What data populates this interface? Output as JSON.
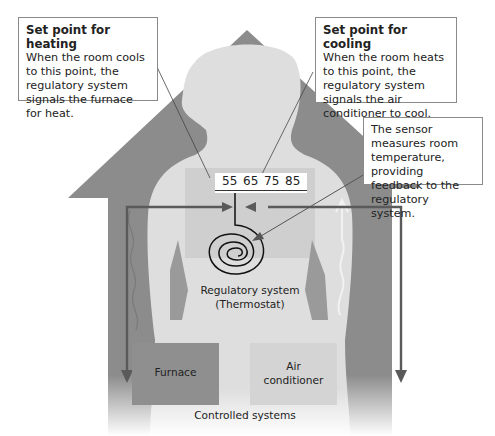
{
  "callouts": {
    "heating": {
      "title": "Set point for heating",
      "body": "When the room cools to this point, the regulatory system signals the furnace for heat."
    },
    "cooling": {
      "title": "Set point for cooling",
      "body": "When the room heats to this point, the regulatory system signals the air conditioner to cool."
    },
    "sensor": {
      "body": "The sensor measures room temperature, providing feedback to the regulatory system."
    }
  },
  "scale": {
    "ticks": [
      "55",
      "65",
      "75",
      "85"
    ]
  },
  "regulatory_system": {
    "line1": "Regulatory system",
    "line2": "(Thermostat)"
  },
  "controlled_systems": {
    "label": "Controlled systems",
    "furnace": "Furnace",
    "air_conditioner_line1": "Air",
    "air_conditioner_line2": "conditioner"
  },
  "colors": {
    "house": "#8c8c8c",
    "body_silhouette": "#dcdcdc",
    "thermostat_panel": "#cfcfcf",
    "furnace": "#8f8f8f",
    "air_conditioner": "#d4d4d4",
    "arrows": "#5a5a5a"
  }
}
